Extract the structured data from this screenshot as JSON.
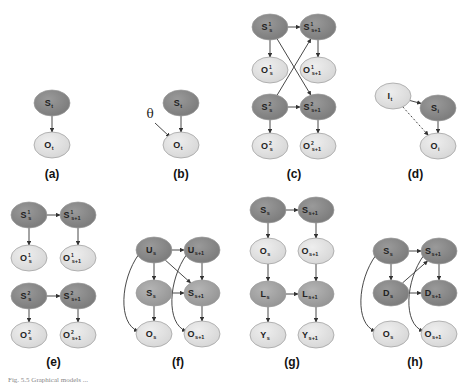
{
  "colors": {
    "dark_node": "#8a8a8a",
    "mid_node": "#a6a6a6",
    "light_node": "#e2e2e2",
    "edge": "#333333",
    "stroke": "#9a9a9a"
  },
  "panels": [
    {
      "id": "a",
      "label": "(a)",
      "nodes": [
        {
          "id": "S",
          "text": "S",
          "sub": "t",
          "x": 52,
          "y": 103,
          "tone": "dark"
        },
        {
          "id": "O",
          "text": "O",
          "sub": "t",
          "x": 52,
          "y": 145,
          "tone": "light"
        }
      ],
      "edges": [
        [
          "S",
          "O",
          "solid"
        ]
      ]
    },
    {
      "id": "b",
      "label": "(b)",
      "theta": "θ",
      "nodes": [
        {
          "id": "S",
          "text": "S",
          "sub": "t",
          "x": 181,
          "y": 103,
          "tone": "dark"
        },
        {
          "id": "O",
          "text": "O",
          "sub": "t",
          "x": 181,
          "y": 145,
          "tone": "light"
        }
      ],
      "edges": [
        [
          "S",
          "O",
          "solid"
        ]
      ]
    },
    {
      "id": "c",
      "label": "(c)",
      "nodes": [
        {
          "id": "S1",
          "text": "S",
          "sub": "s",
          "sup": "1",
          "x": 270,
          "y": 27,
          "tone": "dark"
        },
        {
          "id": "S1n",
          "text": "S",
          "sub": "s+1",
          "sup": "1",
          "x": 318,
          "y": 27,
          "tone": "dark"
        },
        {
          "id": "O1",
          "text": "O",
          "sub": "s",
          "sup": "1",
          "x": 270,
          "y": 70,
          "tone": "light"
        },
        {
          "id": "O1n",
          "text": "O",
          "sub": "s+1",
          "sup": "1",
          "x": 318,
          "y": 70,
          "tone": "light"
        },
        {
          "id": "S2",
          "text": "S",
          "sub": "s",
          "sup": "2",
          "x": 270,
          "y": 107,
          "tone": "dark"
        },
        {
          "id": "S2n",
          "text": "S",
          "sub": "s+1",
          "sup": "2",
          "x": 318,
          "y": 107,
          "tone": "dark"
        },
        {
          "id": "O2",
          "text": "O",
          "sub": "s",
          "sup": "2",
          "x": 270,
          "y": 146,
          "tone": "light"
        },
        {
          "id": "O2n",
          "text": "O",
          "sub": "s+1",
          "sup": "2",
          "x": 318,
          "y": 146,
          "tone": "light"
        }
      ],
      "edges": [
        [
          "S1",
          "S1n",
          "solid"
        ],
        [
          "S1",
          "O1",
          "solid"
        ],
        [
          "S1n",
          "O1n",
          "solid"
        ],
        [
          "S1",
          "S2n",
          "solid"
        ],
        [
          "S2",
          "S1n",
          "solid"
        ],
        [
          "S2",
          "S2n",
          "solid"
        ],
        [
          "S2",
          "O2",
          "solid"
        ],
        [
          "S2n",
          "O2n",
          "solid"
        ]
      ]
    },
    {
      "id": "d",
      "label": "(d)",
      "nodes": [
        {
          "id": "I",
          "text": "I",
          "sub": "t",
          "x": 393,
          "y": 96,
          "tone": "light"
        },
        {
          "id": "S",
          "text": "S",
          "sub": "i",
          "x": 438,
          "y": 108,
          "tone": "dark"
        },
        {
          "id": "O",
          "text": "O",
          "sub": "i",
          "x": 438,
          "y": 146,
          "tone": "light"
        }
      ],
      "edges": [
        [
          "I",
          "S",
          "solid"
        ],
        [
          "I",
          "O",
          "dashed"
        ],
        [
          "S",
          "O",
          "solid"
        ]
      ]
    },
    {
      "id": "e",
      "label": "(e)",
      "nodes": [
        {
          "id": "S1",
          "text": "S",
          "sub": "s",
          "sup": "1",
          "x": 29,
          "y": 215,
          "tone": "dark"
        },
        {
          "id": "S1n",
          "text": "S",
          "sub": "s+1",
          "sup": "1",
          "x": 78,
          "y": 215,
          "tone": "dark"
        },
        {
          "id": "O1",
          "text": "O",
          "sub": "s",
          "sup": "1",
          "x": 29,
          "y": 258,
          "tone": "light"
        },
        {
          "id": "O1n",
          "text": "O",
          "sub": "s+1",
          "sup": "1",
          "x": 78,
          "y": 258,
          "tone": "light"
        },
        {
          "id": "S2",
          "text": "S",
          "sub": "s",
          "sup": "2",
          "x": 29,
          "y": 296,
          "tone": "dark"
        },
        {
          "id": "S2n",
          "text": "S",
          "sub": "s+1",
          "sup": "2",
          "x": 78,
          "y": 296,
          "tone": "dark"
        },
        {
          "id": "O2",
          "text": "O",
          "sub": "s",
          "sup": "2",
          "x": 29,
          "y": 335,
          "tone": "light"
        },
        {
          "id": "O2n",
          "text": "O",
          "sub": "s+1",
          "sup": "2",
          "x": 78,
          "y": 335,
          "tone": "light"
        }
      ],
      "edges": [
        [
          "S1",
          "S1n",
          "solid"
        ],
        [
          "S1",
          "O1",
          "solid"
        ],
        [
          "S1n",
          "O1n",
          "solid"
        ],
        [
          "S2",
          "S2n",
          "solid"
        ],
        [
          "S2",
          "O2",
          "solid"
        ],
        [
          "S2n",
          "O2n",
          "solid"
        ]
      ]
    },
    {
      "id": "f",
      "label": "(f)",
      "nodes": [
        {
          "id": "U",
          "text": "U",
          "sub": "s",
          "x": 154,
          "y": 250,
          "tone": "dark"
        },
        {
          "id": "Un",
          "text": "U",
          "sub": "s+1",
          "x": 202,
          "y": 250,
          "tone": "dark"
        },
        {
          "id": "S",
          "text": "S",
          "sub": "s",
          "x": 154,
          "y": 293,
          "tone": "mid"
        },
        {
          "id": "Sn",
          "text": "S",
          "sub": "s+1",
          "x": 202,
          "y": 293,
          "tone": "mid"
        },
        {
          "id": "O",
          "text": "O",
          "sub": "s",
          "x": 154,
          "y": 334,
          "tone": "light"
        },
        {
          "id": "On",
          "text": "O",
          "sub": "s+1",
          "x": 202,
          "y": 334,
          "tone": "light"
        }
      ],
      "edges": [
        [
          "U",
          "Un",
          "solid"
        ],
        [
          "U",
          "S",
          "solid"
        ],
        [
          "U",
          "Sn",
          "solid"
        ],
        [
          "Un",
          "Sn",
          "solid"
        ],
        [
          "S",
          "Sn",
          "solid"
        ],
        [
          "S",
          "O",
          "solid"
        ],
        [
          "Sn",
          "On",
          "solid"
        ],
        [
          "U",
          "O",
          "curve"
        ],
        [
          "Un",
          "On",
          "curve"
        ]
      ]
    },
    {
      "id": "g",
      "label": "(g)",
      "nodes": [
        {
          "id": "S",
          "text": "S",
          "sub": "s",
          "x": 268,
          "y": 210,
          "tone": "dark"
        },
        {
          "id": "Sn",
          "text": "S",
          "sub": "s+1",
          "x": 316,
          "y": 210,
          "tone": "dark"
        },
        {
          "id": "O",
          "text": "O",
          "sub": "s",
          "x": 268,
          "y": 251,
          "tone": "light"
        },
        {
          "id": "On",
          "text": "O",
          "sub": "s+1",
          "x": 316,
          "y": 251,
          "tone": "light"
        },
        {
          "id": "L",
          "text": "L",
          "sub": "s",
          "x": 268,
          "y": 294,
          "tone": "mid"
        },
        {
          "id": "Ln",
          "text": "L",
          "sub": "s+1",
          "x": 316,
          "y": 294,
          "tone": "mid"
        },
        {
          "id": "Y",
          "text": "Y",
          "sub": "s",
          "x": 268,
          "y": 335,
          "tone": "light"
        },
        {
          "id": "Yn",
          "text": "Y",
          "sub": "s+1",
          "x": 316,
          "y": 335,
          "tone": "light"
        }
      ],
      "edges": [
        [
          "S",
          "Sn",
          "solid"
        ],
        [
          "S",
          "O",
          "solid"
        ],
        [
          "Sn",
          "On",
          "solid"
        ],
        [
          "O",
          "L",
          "solid"
        ],
        [
          "On",
          "Ln",
          "solid"
        ],
        [
          "L",
          "Ln",
          "solid"
        ],
        [
          "L",
          "Y",
          "solid"
        ],
        [
          "Ln",
          "Yn",
          "solid"
        ]
      ]
    },
    {
      "id": "h",
      "label": "(h)",
      "nodes": [
        {
          "id": "S",
          "text": "S",
          "sub": "s",
          "x": 391,
          "y": 251,
          "tone": "dark"
        },
        {
          "id": "Sn",
          "text": "S",
          "sub": "s+1",
          "x": 439,
          "y": 251,
          "tone": "dark"
        },
        {
          "id": "D",
          "text": "D",
          "sub": "s",
          "x": 391,
          "y": 293,
          "tone": "dark"
        },
        {
          "id": "Dn",
          "text": "D",
          "sub": "s+1",
          "x": 439,
          "y": 293,
          "tone": "dark"
        },
        {
          "id": "O",
          "text": "O",
          "sub": "s",
          "x": 391,
          "y": 334,
          "tone": "light"
        },
        {
          "id": "On",
          "text": "O",
          "sub": "s+1",
          "x": 439,
          "y": 334,
          "tone": "light"
        }
      ],
      "edges": [
        [
          "S",
          "Sn",
          "solid"
        ],
        [
          "S",
          "D",
          "solid"
        ],
        [
          "Sn",
          "Dn",
          "solid"
        ],
        [
          "D",
          "Sn",
          "solid"
        ],
        [
          "D",
          "Dn",
          "solid"
        ],
        [
          "S",
          "O",
          "curve"
        ],
        [
          "Sn",
          "On",
          "curve"
        ]
      ]
    }
  ],
  "caption": "Fig. 5.5  Graphical models ..."
}
